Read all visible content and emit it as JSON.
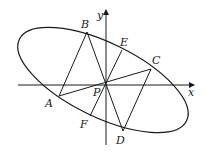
{
  "diagram": {
    "axes": {
      "x_label": "x",
      "y_label": "y"
    },
    "points": {
      "A": "A",
      "B": "B",
      "C": "C",
      "D": "D",
      "E": "E",
      "F": "F",
      "P": "P"
    },
    "stroke_color": "#1a1a1a",
    "background": "#ffffff"
  }
}
